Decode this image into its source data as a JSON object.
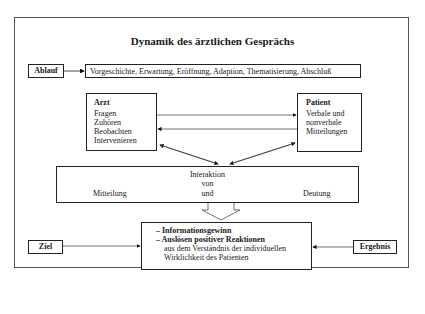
{
  "title": "Dynamik des ärztlichen Gesprächs",
  "ablauf": {
    "label": "Ablauf",
    "sequence": "Vorgeschichte, Erwartung, Eröffnung, Adaption, Thematisierung, Abschluß"
  },
  "arzt": {
    "heading": "Arzt",
    "items": [
      "Fragen",
      "Zuhören",
      "Beobachten",
      "Intervenieren"
    ]
  },
  "patient": {
    "heading": "Patient",
    "items": [
      "Verbale und",
      "nonverbale",
      "Mitteilungen"
    ]
  },
  "interaktion": {
    "line1": "Interaktion",
    "line2": "von",
    "left": "Mitteilung",
    "center": "und",
    "right": "Deutung"
  },
  "ziel": {
    "label": "Ziel"
  },
  "ergebnis": {
    "label": "Ergebnis"
  },
  "outcome": {
    "bullet1": "– Informationsgewinn",
    "bullet2": "– Auslösen positiver Reaktionen",
    "line3": "aus dem Verständnis der individuellen",
    "line4": "Wirklichkeit des Patienten"
  }
}
